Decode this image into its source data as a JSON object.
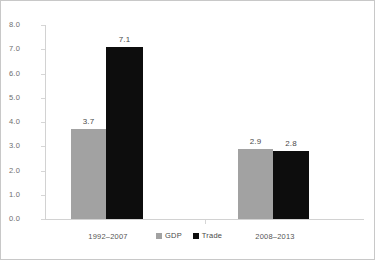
{
  "chart_data": {
    "type": "bar",
    "title": "",
    "subtitle": "",
    "xlabel": "",
    "ylabel": "",
    "categories": [
      "1992–2007",
      "2008–2013"
    ],
    "series": [
      {
        "name": "GDP",
        "color": "#a2a2a2",
        "values": [
          3.7,
          7.1
        ]
      },
      {
        "name": "Trade",
        "color": "#0d0d0d",
        "values": [
          3.7,
          2.8
        ]
      }
    ],
    "bars": [
      {
        "category": "1992–2007",
        "series": "GDP",
        "value": 3.7,
        "label": "3.7",
        "color": "#a2a2a2"
      },
      {
        "category": "1992–2007",
        "series": "Trade",
        "value": 7.1,
        "label": "7.1",
        "color": "#0d0d0d"
      },
      {
        "category": "2008–2013",
        "series": "GDP",
        "value": 2.9,
        "label": "2.9",
        "color": "#a2a2a2"
      },
      {
        "category": "2008–2013",
        "series": "Trade",
        "value": 2.8,
        "label": "2.8",
        "color": "#0d0d0d"
      }
    ],
    "ylim": [
      0.0,
      8.0
    ],
    "ytick_labels": [
      "8.0",
      "7.0",
      "6.0",
      "5.0",
      "4.0",
      "3.0",
      "2.0",
      "1.0",
      "0.0"
    ],
    "ytick_values": [
      8.0,
      7.0,
      6.0,
      5.0,
      4.0,
      3.0,
      2.0,
      1.0,
      0.0
    ],
    "grid": false,
    "legend_position": "bottom-center",
    "legend": [
      {
        "label": "GDP",
        "color": "#a2a2a2"
      },
      {
        "label": "Trade",
        "color": "#0d0d0d"
      }
    ],
    "data_labels_shown": true
  },
  "colors": {
    "gdp": "#a2a2a2",
    "trade": "#0d0d0d",
    "axis": "#d2d2d2",
    "tick_text": "#6e6e6e",
    "label_text": "#4a4a4a",
    "frame": "#c8c8c8",
    "background": "#ffffff"
  },
  "axis": {
    "y_ticks": [
      {
        "label": "8.0",
        "value": 8.0
      },
      {
        "label": "7.0",
        "value": 7.0
      },
      {
        "label": "6.0",
        "value": 6.0
      },
      {
        "label": "5.0",
        "value": 5.0
      },
      {
        "label": "4.0",
        "value": 4.0
      },
      {
        "label": "3.0",
        "value": 3.0
      },
      {
        "label": "2.0",
        "value": 2.0
      },
      {
        "label": "1.0",
        "value": 1.0
      },
      {
        "label": "0.0",
        "value": 0.0
      }
    ]
  },
  "categories": [
    {
      "label": "1992–2007"
    },
    {
      "label": "2008–2013"
    }
  ],
  "legend": {
    "entries": [
      {
        "label": "GDP"
      },
      {
        "label": "Trade"
      }
    ]
  }
}
